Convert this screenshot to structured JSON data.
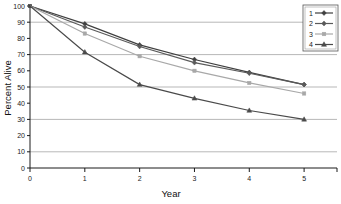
{
  "chart_data": {
    "type": "line",
    "title": "",
    "xlabel": "Year",
    "ylabel": "Percent Alive",
    "x": [
      0,
      1,
      2,
      3,
      4,
      5
    ],
    "xtick_labels": [
      "0",
      "1",
      "2",
      "3",
      "4",
      "5"
    ],
    "ytick_labels": [
      "0",
      "10",
      "20",
      "30",
      "40",
      "50",
      "60",
      "70",
      "80",
      "90",
      "100"
    ],
    "ytick_values": [
      0,
      10,
      20,
      30,
      40,
      50,
      60,
      70,
      80,
      90,
      100
    ],
    "xlim": [
      0,
      5.6
    ],
    "ylim": [
      0,
      100
    ],
    "grid": true,
    "gridlines_y": [
      10,
      30,
      50,
      70,
      90
    ],
    "legend_position": "upper-right",
    "series": [
      {
        "name": "1",
        "marker": "diamond",
        "color": "#3f3f3f",
        "values": [
          100,
          89,
          76,
          67,
          59,
          51.5
        ]
      },
      {
        "name": "2",
        "marker": "diamond",
        "color": "#5a5a5a",
        "values": [
          100,
          87,
          75,
          65,
          58.5,
          51.5
        ]
      },
      {
        "name": "3",
        "marker": "square",
        "color": "#a8a8a8",
        "values": [
          100,
          83,
          69,
          60,
          52.5,
          46
        ]
      },
      {
        "name": "4",
        "marker": "triangle",
        "color": "#4a4a4a",
        "values": [
          100,
          71.5,
          51.5,
          43,
          35.5,
          30
        ]
      }
    ]
  },
  "legend": {
    "entries": [
      {
        "label": "1"
      },
      {
        "label": "2"
      },
      {
        "label": "3"
      },
      {
        "label": "4"
      }
    ]
  },
  "axes": {
    "x_title": "Year",
    "y_title": "Percent Alive"
  },
  "colors": {
    "grid": "#9a9a9a",
    "axis": "#1a1a1a",
    "background": "#ffffff",
    "legend_border": "#555555"
  }
}
